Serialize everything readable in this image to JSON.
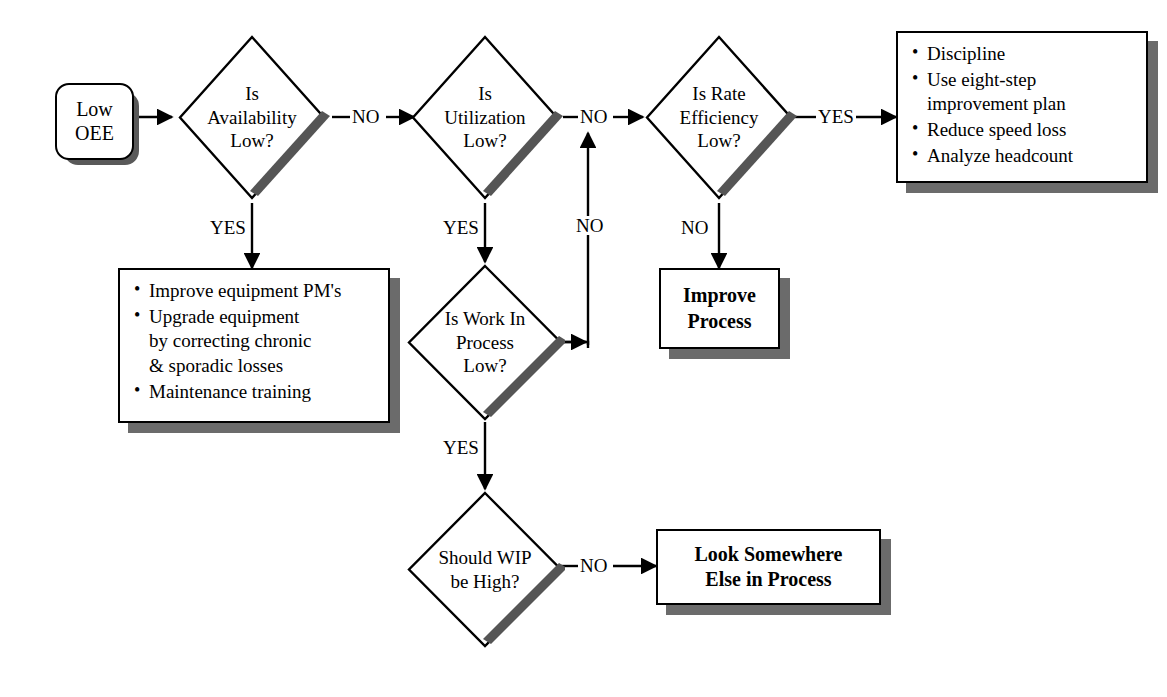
{
  "diagram": {
    "colors": {
      "ink": "#000000",
      "paper": "#ffffff",
      "shadow": "#6b6b6b",
      "diamond_shadow": "#555555"
    }
  },
  "nodes": {
    "start": {
      "id": "low-oee",
      "type": "terminator",
      "text": "Low\nOEE"
    },
    "d_availability": {
      "id": "is-availability-low",
      "type": "decision",
      "text": "Is\nAvailability\nLow?"
    },
    "d_utilization": {
      "id": "is-utilization-low",
      "type": "decision",
      "text": "Is\nUtilization\nLow?"
    },
    "d_rate_efficiency": {
      "id": "is-rate-efficiency-low",
      "type": "decision",
      "text": "Is Rate\nEfficiency\nLow?"
    },
    "d_wip_low": {
      "id": "is-work-in-process-low",
      "type": "decision",
      "text": "Is Work In\nProcess\nLow?"
    },
    "d_wip_high": {
      "id": "should-wip-be-high",
      "type": "decision",
      "text": "Should WIP\nbe High?"
    },
    "b_availability_actions": {
      "id": "availability-actions",
      "type": "bullet-box",
      "bullets": [
        "Improve equipment PM's",
        "Upgrade equipment\nby correcting chronic\n& sporadic losses",
        "Maintenance training"
      ]
    },
    "b_rate_actions": {
      "id": "rate-efficiency-actions",
      "type": "bullet-box",
      "bullets": [
        "Discipline",
        "Use eight-step\nimprovement plan",
        "Reduce speed loss",
        "Analyze headcount"
      ]
    },
    "b_improve_process": {
      "id": "improve-process",
      "type": "process-box",
      "text": "Improve\nProcess"
    },
    "b_look_elsewhere": {
      "id": "look-somewhere-else-in-process",
      "type": "process-box",
      "text": "Look Somewhere\nElse in Process"
    }
  },
  "edges": [
    {
      "id": "start-to-availability",
      "from": "low-oee",
      "to": "is-availability-low",
      "label": ""
    },
    {
      "id": "availability-no",
      "from": "is-availability-low",
      "to": "is-utilization-low",
      "label": "NO"
    },
    {
      "id": "availability-yes",
      "from": "is-availability-low",
      "to": "availability-actions",
      "label": "YES"
    },
    {
      "id": "utilization-no",
      "from": "is-utilization-low",
      "to": "is-rate-efficiency-low",
      "label": "NO"
    },
    {
      "id": "utilization-yes",
      "from": "is-utilization-low",
      "to": "is-work-in-process-low",
      "label": "YES"
    },
    {
      "id": "rate-efficiency-yes",
      "from": "is-rate-efficiency-low",
      "to": "rate-efficiency-actions",
      "label": "YES"
    },
    {
      "id": "rate-efficiency-no",
      "from": "is-rate-efficiency-low",
      "to": "improve-process",
      "label": "NO"
    },
    {
      "id": "wip-low-no",
      "from": "is-work-in-process-low",
      "to": "utilization-no-junction",
      "label": "NO"
    },
    {
      "id": "wip-low-yes",
      "from": "is-work-in-process-low",
      "to": "should-wip-be-high",
      "label": "YES"
    },
    {
      "id": "wip-high-no",
      "from": "should-wip-be-high",
      "to": "look-somewhere-else-in-process",
      "label": "NO"
    }
  ],
  "edge_labels": {
    "availability_no": "NO",
    "availability_yes": "YES",
    "utilization_no": "NO",
    "utilization_yes": "YES",
    "rate_yes": "YES",
    "rate_no": "NO",
    "wip_low_no": "NO",
    "wip_low_yes": "YES",
    "wip_high_no": "NO"
  }
}
